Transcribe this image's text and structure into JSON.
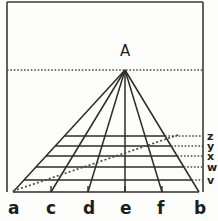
{
  "figure": {
    "title_label": "A",
    "apex": {
      "label": "A",
      "x": 125,
      "y": 70
    },
    "baseline_y": 192,
    "frame": {
      "left_x": 7,
      "right_x": 203,
      "top_y": 2,
      "color": "#3a3a3a"
    },
    "colors": {
      "stroke": "#2b2b2b",
      "dotted": "#4a4a4a",
      "background": "#fdfdfb",
      "text": "#1d1d1d"
    },
    "baseline_points": [
      {
        "label": "a",
        "x": 13,
        "tick": false
      },
      {
        "label": "c",
        "x": 51,
        "tick": true
      },
      {
        "label": "d",
        "x": 88,
        "tick": true
      },
      {
        "label": "e",
        "x": 125,
        "tick": true
      },
      {
        "label": "f",
        "x": 162,
        "tick": true
      },
      {
        "label": "b",
        "x": 199,
        "tick": false
      }
    ],
    "side_points": [
      {
        "label": "z",
        "y": 136
      },
      {
        "label": "y",
        "y": 146
      },
      {
        "label": "x",
        "y": 156
      },
      {
        "label": "w",
        "y": 167
      },
      {
        "label": "v",
        "y": 180
      }
    ],
    "grid_rows": [
      {
        "y": 136
      },
      {
        "y": 146
      },
      {
        "y": 156
      },
      {
        "y": 167
      },
      {
        "y": 180
      }
    ],
    "horizon": {
      "y": 70,
      "from_x": 7,
      "to_x": 203
    },
    "diagonal": {
      "from_x": 13,
      "from_y": 191,
      "to_x": 178,
      "to_y": 135
    }
  }
}
